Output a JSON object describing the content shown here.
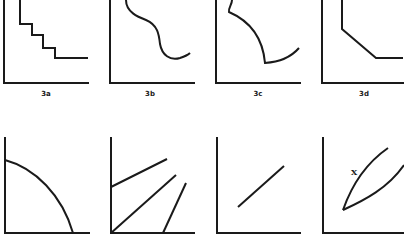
{
  "figure": {
    "panels": [
      {
        "id": "3a",
        "label": "3a",
        "shape": "staircase descending"
      },
      {
        "id": "3b",
        "label": "3b",
        "shape": "S-curve descending then rising"
      },
      {
        "id": "3c",
        "label": "3c",
        "shape": "concave-down decline with cusp then rise"
      },
      {
        "id": "3d",
        "label": "3d",
        "shape": "vertical, diagonal, horizontal segments"
      },
      {
        "id": "4a",
        "label": "",
        "shape": "quarter-circle arc decreasing"
      },
      {
        "id": "4b",
        "label": "",
        "shape": "three straight lines"
      },
      {
        "id": "4c",
        "label": "",
        "shape": "single straight rising segment"
      },
      {
        "id": "4d",
        "label": "",
        "shape": "two curves diverging from a common origin",
        "annotation": "X"
      }
    ]
  },
  "colors": {
    "ink": "#1a1a1a",
    "background": "#ffffff"
  }
}
